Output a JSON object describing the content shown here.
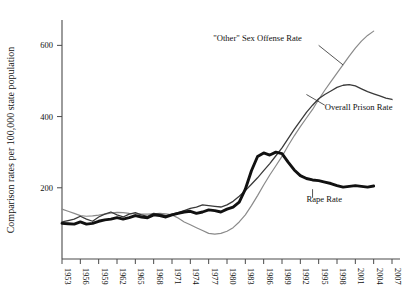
{
  "chart_data": {
    "type": "line",
    "title": "",
    "xlabel": "",
    "ylabel": "Comparison rates per 100,000 state population",
    "xlim": [
      1953,
      2007
    ],
    "ylim": [
      0,
      660
    ],
    "yticks": [
      200,
      400,
      600
    ],
    "xticks": [
      1953,
      1956,
      1959,
      1962,
      1965,
      1968,
      1971,
      1974,
      1977,
      1980,
      1983,
      1986,
      1989,
      1992,
      1995,
      1998,
      2001,
      2004,
      2007
    ],
    "grid": false,
    "legend_position": "inline-annotations",
    "annotations": [
      {
        "name": "other-sex-offense-label",
        "text": "\"Other\" Sex Offense Rate",
        "x": 1985,
        "y": 612
      },
      {
        "name": "overall-prison-label",
        "text": "Overall Prison Rate",
        "x": 1996,
        "y": 418
      },
      {
        "name": "rape-rate-label",
        "text": "Rape Rate",
        "x": 1993,
        "y": 160
      }
    ],
    "series": [
      {
        "name": "\"Other\" Sex Offense Rate",
        "color": "#8a8a8a",
        "width": 1.2,
        "x": [
          1953,
          1954,
          1955,
          1956,
          1957,
          1958,
          1959,
          1960,
          1961,
          1962,
          1963,
          1964,
          1965,
          1966,
          1967,
          1968,
          1969,
          1970,
          1971,
          1972,
          1973,
          1974,
          1975,
          1976,
          1977,
          1978,
          1979,
          1980,
          1981,
          1982,
          1983,
          1984,
          1985,
          1986,
          1987,
          1988,
          1989,
          1990,
          1991,
          1992,
          1993,
          1994,
          1995,
          1996,
          1997,
          1998,
          1999,
          2000,
          2001,
          2002,
          2003,
          2004
        ],
        "values": [
          140,
          134,
          128,
          122,
          120,
          121,
          123,
          126,
          129,
          131,
          130,
          128,
          127,
          126,
          126,
          127,
          128,
          127,
          124,
          115,
          104,
          96,
          88,
          80,
          72,
          70,
          72,
          78,
          88,
          104,
          124,
          150,
          178,
          208,
          236,
          262,
          288,
          318,
          346,
          372,
          396,
          420,
          448,
          474,
          498,
          522,
          546,
          570,
          592,
          612,
          628,
          640
        ]
      },
      {
        "name": "Overall Prison Rate",
        "color": "#3a3a3a",
        "width": 1.3,
        "x": [
          1953,
          1954,
          1955,
          1956,
          1957,
          1958,
          1959,
          1960,
          1961,
          1962,
          1963,
          1964,
          1965,
          1966,
          1967,
          1968,
          1969,
          1970,
          1971,
          1972,
          1973,
          1974,
          1975,
          1976,
          1977,
          1978,
          1979,
          1980,
          1981,
          1982,
          1983,
          1984,
          1985,
          1986,
          1987,
          1988,
          1989,
          1990,
          1991,
          1992,
          1993,
          1994,
          1995,
          1996,
          1997,
          1998,
          1999,
          2000,
          2001,
          2002,
          2003,
          2004,
          2005,
          2006,
          2007
        ],
        "values": [
          104,
          108,
          112,
          120,
          112,
          106,
          118,
          126,
          132,
          124,
          118,
          126,
          130,
          124,
          120,
          128,
          126,
          122,
          126,
          130,
          136,
          142,
          146,
          152,
          150,
          148,
          146,
          152,
          162,
          176,
          192,
          210,
          228,
          248,
          268,
          290,
          312,
          338,
          364,
          388,
          412,
          432,
          450,
          462,
          472,
          482,
          488,
          490,
          486,
          478,
          470,
          464,
          458,
          452,
          448
        ]
      },
      {
        "name": "Rape Rate",
        "color": "#111111",
        "width": 2.9,
        "x": [
          1953,
          1954,
          1955,
          1956,
          1957,
          1958,
          1959,
          1960,
          1961,
          1962,
          1963,
          1964,
          1965,
          1966,
          1967,
          1968,
          1969,
          1970,
          1971,
          1972,
          1973,
          1974,
          1975,
          1976,
          1977,
          1978,
          1979,
          1980,
          1981,
          1982,
          1983,
          1984,
          1985,
          1986,
          1987,
          1988,
          1989,
          1990,
          1991,
          1992,
          1993,
          1994,
          1995,
          1996,
          1997,
          1998,
          1999,
          2000,
          2001,
          2002,
          2003,
          2004
        ],
        "values": [
          100,
          99,
          98,
          104,
          98,
          100,
          106,
          110,
          112,
          116,
          112,
          116,
          122,
          118,
          116,
          124,
          122,
          118,
          124,
          128,
          132,
          134,
          128,
          132,
          138,
          136,
          132,
          140,
          146,
          160,
          196,
          248,
          288,
          298,
          292,
          300,
          296,
          272,
          250,
          234,
          226,
          222,
          220,
          216,
          212,
          206,
          202,
          204,
          206,
          204,
          202,
          205
        ]
      }
    ]
  },
  "axis": {
    "ylabel": "Comparison rates per 100,000 state population"
  }
}
